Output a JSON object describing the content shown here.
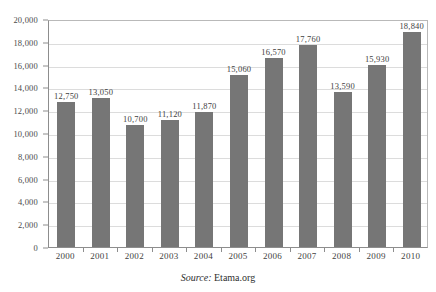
{
  "chart_data": {
    "type": "bar",
    "title": "",
    "subtitle": "",
    "xlabel": "",
    "ylabel": "",
    "ylim": [
      0,
      20000
    ],
    "ytick_step": 2000,
    "grid": true,
    "legend": "none",
    "bar_color": "#767676",
    "categories": [
      "2000",
      "2001",
      "2002",
      "2003",
      "2004",
      "2005",
      "2006",
      "2007",
      "2008",
      "2009",
      "2010"
    ],
    "values": [
      12750,
      13050,
      10700,
      11120,
      11870,
      15060,
      16570,
      17760,
      13590,
      15930,
      18840
    ],
    "value_labels": [
      "12,750",
      "13,050",
      "10,700",
      "11,120",
      "11,870",
      "15,060",
      "16,570",
      "17,760",
      "13,590",
      "15,930",
      "18,840"
    ],
    "ytick_labels": [
      "20,000",
      "18,000",
      "16,000",
      "14,000",
      "12,000",
      "10,000",
      "8,000",
      "6,000",
      "4,000",
      "2,000",
      "0"
    ],
    "ytick_values": [
      20000,
      18000,
      16000,
      14000,
      12000,
      10000,
      8000,
      6000,
      4000,
      2000,
      0
    ]
  },
  "source": {
    "label": "Source:",
    "value": "Etama.org"
  }
}
